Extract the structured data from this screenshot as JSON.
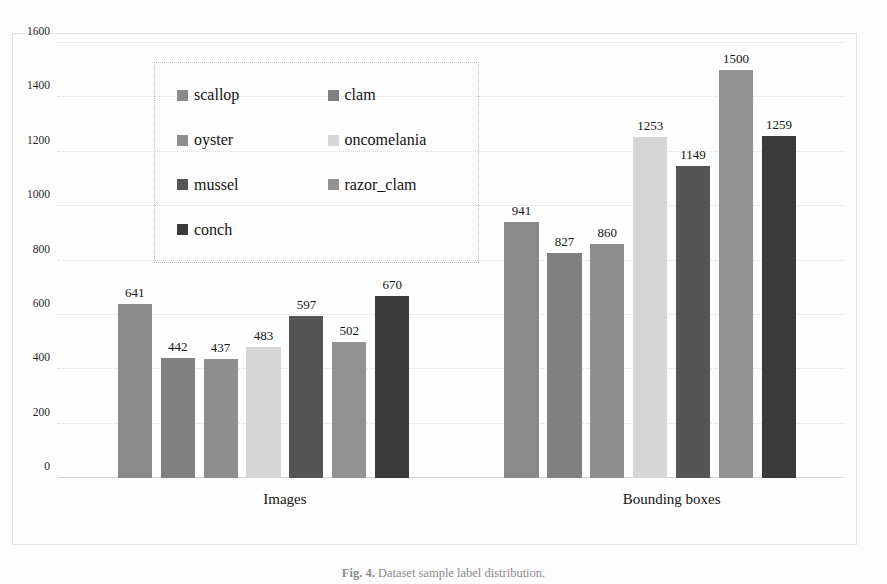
{
  "figure": {
    "caption_label": "Fig. 4.",
    "caption_text": "Dataset sample label distribution."
  },
  "chart_data": {
    "type": "bar",
    "title": "",
    "xlabel": "",
    "ylabel": "",
    "ylim": [
      0,
      1600
    ],
    "yticks": [
      1600,
      1400,
      1200,
      1000,
      800,
      600,
      400,
      200,
      0
    ],
    "grid": true,
    "legend_position": "inside-upper-left",
    "categories": [
      "Images",
      "Bounding boxes"
    ],
    "series": [
      {
        "name": "scallop",
        "color": "#8a8a8a",
        "values": [
          641,
          941
        ]
      },
      {
        "name": "clam",
        "color": "#808080",
        "values": [
          442,
          827
        ]
      },
      {
        "name": "oyster",
        "color": "#8e8e8e",
        "values": [
          437,
          860
        ]
      },
      {
        "name": "oncomelania",
        "color": "#d6d6d6",
        "values": [
          483,
          1253
        ]
      },
      {
        "name": "mussel",
        "color": "#555555",
        "values": [
          597,
          1149
        ]
      },
      {
        "name": "razor_clam",
        "color": "#929292",
        "values": [
          502,
          1500
        ]
      },
      {
        "name": "conch",
        "color": "#3b3b3b",
        "values": [
          670,
          1259
        ]
      }
    ]
  },
  "legend": {
    "items": [
      {
        "label": "scallop",
        "color": "#8a8a8a"
      },
      {
        "label": "clam",
        "color": "#808080"
      },
      {
        "label": "oyster",
        "color": "#8e8e8e"
      },
      {
        "label": "oncomelania",
        "color": "#d6d6d6"
      },
      {
        "label": "mussel",
        "color": "#555555"
      },
      {
        "label": "razor_clam",
        "color": "#929292"
      },
      {
        "label": "conch",
        "color": "#3b3b3b"
      }
    ]
  }
}
